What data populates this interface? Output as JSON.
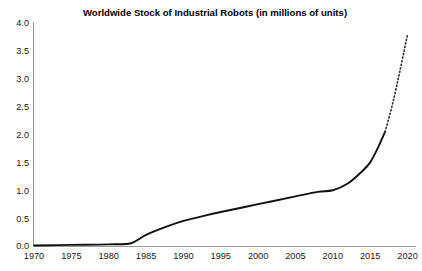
{
  "chart_data": {
    "type": "line",
    "title": "Worldwide Stock of Industrial Robots (in millions of units)",
    "xlabel": "",
    "ylabel": "",
    "xlim": [
      1970,
      2021
    ],
    "ylim": [
      0.0,
      4.0
    ],
    "grid": false,
    "legend": "none",
    "x_ticks": [
      "1970",
      "1975",
      "1980",
      "1985",
      "1990",
      "1995",
      "2000",
      "2005",
      "2010",
      "2015",
      "2020"
    ],
    "x_tick_values": [
      1970,
      1975,
      1980,
      1985,
      1990,
      1995,
      2000,
      2005,
      2010,
      2015,
      2020
    ],
    "y_ticks": [
      "0.0",
      "0.5",
      "1.0",
      "1.5",
      "2.0",
      "2.5",
      "3.0",
      "3.5",
      "4.0"
    ],
    "y_tick_values": [
      0.0,
      0.5,
      1.0,
      1.5,
      2.0,
      2.5,
      3.0,
      3.5,
      4.0
    ],
    "series": [
      {
        "name": "Actual stock",
        "style": "solid",
        "color": "#111111",
        "x": [
          1970,
          1975,
          1980,
          1983,
          1985,
          1988,
          1990,
          1993,
          1995,
          2000,
          2005,
          2008,
          2010,
          2012,
          2014,
          2015,
          2016,
          2017
        ],
        "values": [
          0.01,
          0.02,
          0.03,
          0.05,
          0.2,
          0.36,
          0.45,
          0.55,
          0.61,
          0.75,
          0.89,
          0.97,
          1.0,
          1.12,
          1.35,
          1.5,
          1.75,
          2.05
        ]
      },
      {
        "name": "Projection",
        "style": "dotted",
        "color": "#333333",
        "x": [
          2017,
          2018,
          2019,
          2020
        ],
        "values": [
          2.05,
          2.55,
          3.15,
          3.8
        ]
      }
    ]
  },
  "axes": {
    "x_axis_name": "year-axis",
    "y_axis_name": "millions-of-units-axis"
  }
}
